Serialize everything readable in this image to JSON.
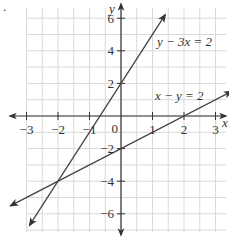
{
  "chart_data": {
    "type": "line",
    "title": "",
    "xlabel": "x",
    "ylabel": "y",
    "xlim": [
      -3.5,
      3.5
    ],
    "ylim": [
      -7.2,
      7.2
    ],
    "grid": true,
    "grid_step_x": 0.5,
    "grid_step_y": 1,
    "x_ticks": [
      -3,
      -2,
      -1,
      0,
      1,
      2,
      3
    ],
    "x_tick_labels": [
      "−3",
      "−2",
      "−1",
      "0",
      "1",
      "2",
      "3"
    ],
    "y_ticks": [
      -6,
      -4,
      -2,
      2,
      4,
      6
    ],
    "y_tick_labels": [
      "−6",
      "−4",
      "−2",
      "2",
      "4",
      "6"
    ],
    "origin_label": "0",
    "series": [
      {
        "name": "y − 3x = 2",
        "equation": "y = 3x + 2",
        "slope": 3,
        "intercept": 2,
        "points": [
          [
            -2.9,
            -6.7
          ],
          [
            1.4,
            6.2
          ]
        ]
      },
      {
        "name": "x − y = 2",
        "equation": "y = x − 2",
        "slope": 1,
        "intercept": -2,
        "points": [
          [
            -3.5,
            -5.5
          ],
          [
            3.5,
            1.5
          ]
        ]
      }
    ],
    "intersection": [
      -2,
      -4
    ],
    "annotations": [
      {
        "text": "y − 3x = 2",
        "x": 1.5,
        "y": 4.7
      },
      {
        "text": "x − y = 2",
        "x": 1.5,
        "y": 1.4
      }
    ]
  },
  "labels": {
    "x_axis": "x",
    "y_axis": "y",
    "line1": "y − 3x = 2",
    "line2": "x − y = 2",
    "origin": "0",
    "bullet": "."
  }
}
